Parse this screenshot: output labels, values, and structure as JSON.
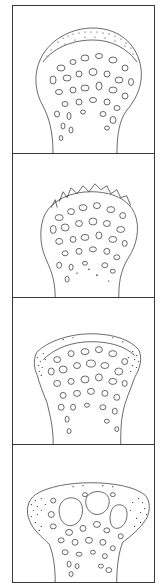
{
  "figure": {
    "type": "multi-panel line drawing",
    "panel_count": 4,
    "stroke_color": "#2a2a2a",
    "border_color": "#3a3a3a",
    "background": "#ffffff",
    "panels": [
      {
        "index": 1,
        "label": "stage-1",
        "description": "Rounded bone head with stippled cap, fine trabecular pattern"
      },
      {
        "index": 2,
        "label": "stage-2",
        "description": "Bone head with irregular eroded surface spicules on top"
      },
      {
        "index": 3,
        "label": "stage-3",
        "description": "Flattened head with stippled lateral lips (osteophytes)"
      },
      {
        "index": 4,
        "label": "stage-4",
        "description": "Mushroom-shaped head with large cysts and stippled lateral lips"
      }
    ]
  }
}
